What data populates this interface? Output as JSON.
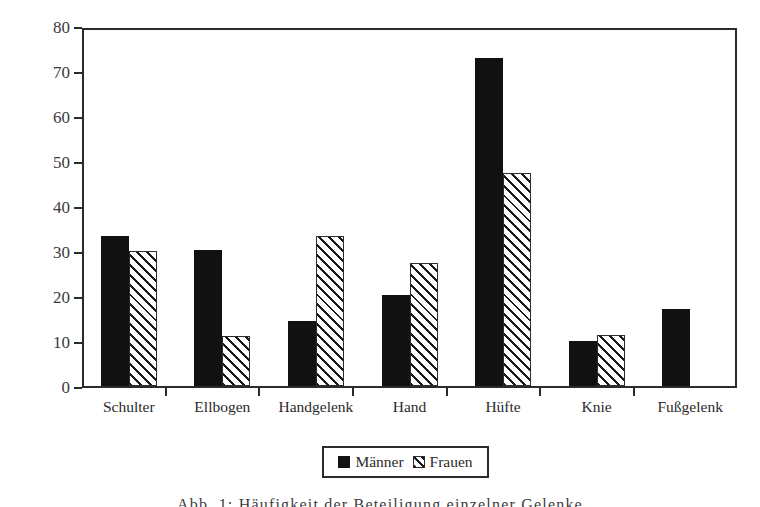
{
  "chart_data": {
    "type": "bar",
    "title": "",
    "xlabel": "",
    "ylabel": "Anteil der Betroffenen (%)",
    "ylim": [
      0,
      80
    ],
    "ytick_step": 10,
    "yticks": [
      0,
      10,
      20,
      30,
      40,
      50,
      60,
      70,
      80
    ],
    "grid": false,
    "legend_position": "bottom-center",
    "categories": [
      "Schulter",
      "Ellbogen",
      "Handgelenk",
      "Hand",
      "Hüfte",
      "Knie",
      "Fußgelenk"
    ],
    "series": [
      {
        "name": "Männer",
        "fill": "solid-black",
        "color": "#111111",
        "values": [
          33.4,
          30.3,
          14.4,
          20.2,
          72.8,
          10.0,
          17.2
        ]
      },
      {
        "name": "Frauen",
        "fill": "diagonal-hatch",
        "color": "#ffffff",
        "values": [
          30.0,
          11.2,
          33.3,
          27.3,
          47.3,
          11.3,
          null
        ]
      }
    ]
  },
  "legend": {
    "items": [
      {
        "label": "Männer",
        "swatch": "solid-black-swatch"
      },
      {
        "label": "Frauen",
        "swatch": "hatched-swatch"
      }
    ]
  },
  "caption": {
    "text": "Abb. 1: Häufigkeit der Beteiligung einzelner Gelenke"
  },
  "colors": {
    "axis": "#2b2b2b",
    "series_maenner": "#111111",
    "series_frauen_outline": "#2b2b2b",
    "background": "#ffffff",
    "text": "#3a3a3a"
  }
}
